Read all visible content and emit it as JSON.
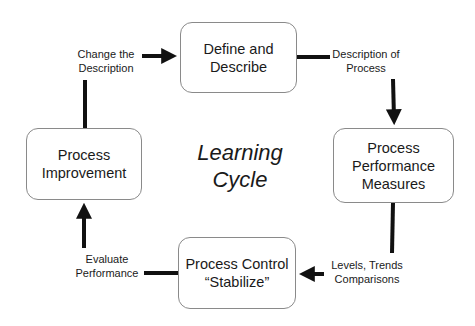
{
  "title": "Learning\nCycle",
  "nodes": [
    {
      "id": "define",
      "label": "Define and\nDescribe"
    },
    {
      "id": "measures",
      "label": "Process\nPerformance\nMeasures"
    },
    {
      "id": "control",
      "label": "Process Control\n“Stabilize”"
    },
    {
      "id": "improvement",
      "label": "Process\nImprovement"
    }
  ],
  "edges": [
    {
      "from": "define",
      "to": "measures",
      "label": "Description of\nProcess"
    },
    {
      "from": "measures",
      "to": "control",
      "label": "Levels, Trends\nComparisons"
    },
    {
      "from": "control",
      "to": "improvement",
      "label": "Evaluate\nPerformance"
    },
    {
      "from": "improvement",
      "to": "define",
      "label": "Change the\nDescription"
    }
  ],
  "colors": {
    "box_border": "#8a8a8a",
    "arrow": "#111111",
    "text": "#1a1a1a"
  }
}
